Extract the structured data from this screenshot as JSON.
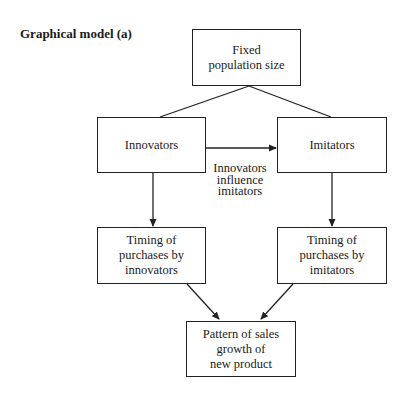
{
  "title": "Graphical model (a)",
  "nodes": {
    "population": {
      "label": "Fixed\npopulation size"
    },
    "innovators": {
      "label": "Innovators"
    },
    "imitators": {
      "label": "Imitators"
    },
    "timing_innovators": {
      "label": "Timing of\npurchases by\ninnovators"
    },
    "timing_imitators": {
      "label": "Timing of\npurchases by\nimitators"
    },
    "sales_pattern": {
      "label": "Pattern of sales\ngrowth of\nnew product"
    }
  },
  "edges": [
    {
      "from": "population",
      "to": "innovators",
      "arrow": false
    },
    {
      "from": "population",
      "to": "imitators",
      "arrow": false
    },
    {
      "from": "innovators",
      "to": "imitators",
      "arrow": true,
      "label": "Innovators\ninfluence\nimitators"
    },
    {
      "from": "innovators",
      "to": "timing_innovators",
      "arrow": true
    },
    {
      "from": "imitators",
      "to": "timing_imitators",
      "arrow": true
    },
    {
      "from": "timing_innovators",
      "to": "sales_pattern",
      "arrow": true
    },
    {
      "from": "timing_imitators",
      "to": "sales_pattern",
      "arrow": true
    }
  ]
}
